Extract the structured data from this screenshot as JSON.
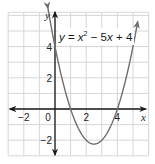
{
  "chart_data": {
    "type": "line",
    "title": "",
    "function": "y = x^2 - 5x + 4",
    "equation_label": {
      "prefix_var": "y",
      "equals": " = ",
      "x_var": "x",
      "exponent": "2",
      "middle": " − 5",
      "x_var2": "x",
      "suffix": " + 4"
    },
    "xlabel": "x",
    "ylabel": "y",
    "xlim": [
      -3,
      6
    ],
    "ylim": [
      -3,
      6.2
    ],
    "grid": true,
    "grid_step": 1,
    "x_tick_labels": [
      {
        "value": -2,
        "label": "−2"
      },
      {
        "value": 0,
        "label": "0"
      },
      {
        "value": 2,
        "label": "2"
      },
      {
        "value": 4,
        "label": "4"
      }
    ],
    "y_tick_labels": [
      {
        "value": 4,
        "label": "4"
      },
      {
        "value": 2,
        "label": "2"
      },
      {
        "value": -2,
        "label": "−2"
      }
    ],
    "series": [
      {
        "name": "y = x^2 - 5x + 4",
        "x": [
          -0.45,
          0,
          0.5,
          1,
          1.5,
          2,
          2.5,
          3,
          3.5,
          4,
          4.5,
          5,
          5.3
        ],
        "y": [
          6.45,
          4,
          1.75,
          0,
          -1.25,
          -2,
          -2.25,
          -2,
          -1.25,
          0,
          1.75,
          4,
          5.59
        ]
      }
    ],
    "key_points": {
      "y_intercept": [
        0,
        4
      ],
      "x_intercepts": [
        [
          1,
          0
        ],
        [
          4,
          0
        ]
      ],
      "vertex": [
        2.5,
        -2.25
      ]
    },
    "colors": {
      "curve": "#6f6f6f",
      "axes": "#1a1a1a",
      "grid": "#d6d6d6"
    }
  }
}
